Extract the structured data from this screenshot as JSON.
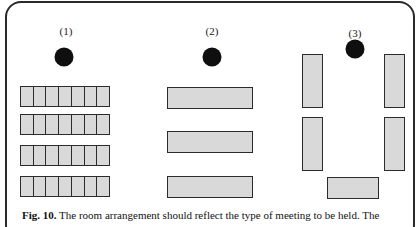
{
  "figure": {
    "layouts": [
      {
        "label": "(1)",
        "label_pos": [
          66,
          25
        ],
        "speaker_dot": [
          64,
          57
        ],
        "seat_rows": [
          {
            "x": 20,
            "y": 86,
            "w": 90,
            "h": 21,
            "seats": 7
          },
          {
            "x": 20,
            "y": 114,
            "w": 90,
            "h": 21,
            "seats": 7
          },
          {
            "x": 20,
            "y": 145,
            "w": 90,
            "h": 21,
            "seats": 7
          },
          {
            "x": 20,
            "y": 176,
            "w": 90,
            "h": 21,
            "seats": 7
          }
        ]
      },
      {
        "label": "(2)",
        "label_pos": [
          212,
          25
        ],
        "speaker_dot": [
          212,
          57
        ],
        "tables": [
          {
            "x": 167,
            "y": 87,
            "w": 86,
            "h": 22
          },
          {
            "x": 167,
            "y": 131,
            "w": 86,
            "h": 22
          },
          {
            "x": 167,
            "y": 176,
            "w": 86,
            "h": 22
          }
        ]
      },
      {
        "label": "(3)",
        "label_pos": [
          355,
          27
        ],
        "speaker_dot": [
          355,
          49
        ],
        "tables": [
          {
            "x": 302,
            "y": 54,
            "w": 21,
            "h": 54
          },
          {
            "x": 384,
            "y": 54,
            "w": 21,
            "h": 54
          },
          {
            "x": 302,
            "y": 117,
            "w": 21,
            "h": 54
          },
          {
            "x": 384,
            "y": 117,
            "w": 21,
            "h": 54
          },
          {
            "x": 327,
            "y": 177,
            "w": 52,
            "h": 22
          }
        ]
      }
    ],
    "caption": {
      "prefix": "Fig. 10.",
      "text": " The room arrangement should reflect the type of meeting to be held. The",
      "second_line_partial": "audit..."
    }
  },
  "colors": {
    "frame": "#2a2a2a",
    "table_fill": "#d9d9d9",
    "outline": "#2b2b2b",
    "dot": "#0f0f0f"
  }
}
